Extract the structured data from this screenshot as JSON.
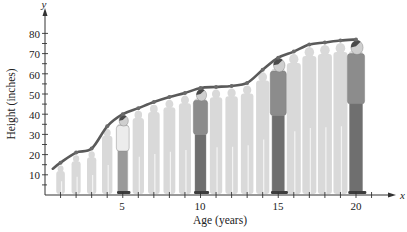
{
  "chart_data": {
    "type": "line",
    "title": "",
    "xlabel": "Age (years)",
    "ylabel": "Height (inches)",
    "x_axis_var": "x",
    "y_axis_var": "y",
    "xlim": [
      0,
      22
    ],
    "ylim": [
      0,
      85
    ],
    "x_ticks": [
      5,
      10,
      15,
      20
    ],
    "y_ticks": [
      10,
      20,
      30,
      40,
      50,
      60,
      70,
      80
    ],
    "grid": false,
    "legend": null,
    "series": [
      {
        "name": "Height",
        "x": [
          0.5,
          1,
          2,
          3,
          4,
          5,
          6,
          7,
          8,
          9,
          10,
          11,
          12,
          13,
          14,
          15,
          16,
          17,
          18,
          19,
          20
        ],
        "values": [
          13,
          16,
          21,
          23,
          34,
          40,
          43,
          46,
          48.5,
          50.5,
          53,
          53.5,
          54,
          55.5,
          62,
          68,
          71,
          74.5,
          75.5,
          76.5,
          77
        ]
      }
    ],
    "annotations": [
      "Illustrated silhouettes of a person growing from toddler to adult beneath the curve; highlighted figures at ages 5, 10, 15 and 20"
    ]
  },
  "labels": {
    "x_axis_title": "Age (years)",
    "y_axis_title": "Height (inches)",
    "x_var": "x",
    "y_var": "y",
    "x_tick_5": "5",
    "x_tick_10": "10",
    "x_tick_15": "15",
    "x_tick_20": "20",
    "y_tick_10": "10",
    "y_tick_20": "20",
    "y_tick_30": "30",
    "y_tick_40": "40",
    "y_tick_50": "50",
    "y_tick_60": "60",
    "y_tick_70": "70",
    "y_tick_80": "80"
  },
  "colors": {
    "curve": "#5a5a5a",
    "points": "#6a6a6a",
    "silhouette": "#d9d9d9",
    "figure_shirt": "#8c8c8c",
    "figure_pants": "#6f6f6f",
    "axis": "#333333"
  }
}
